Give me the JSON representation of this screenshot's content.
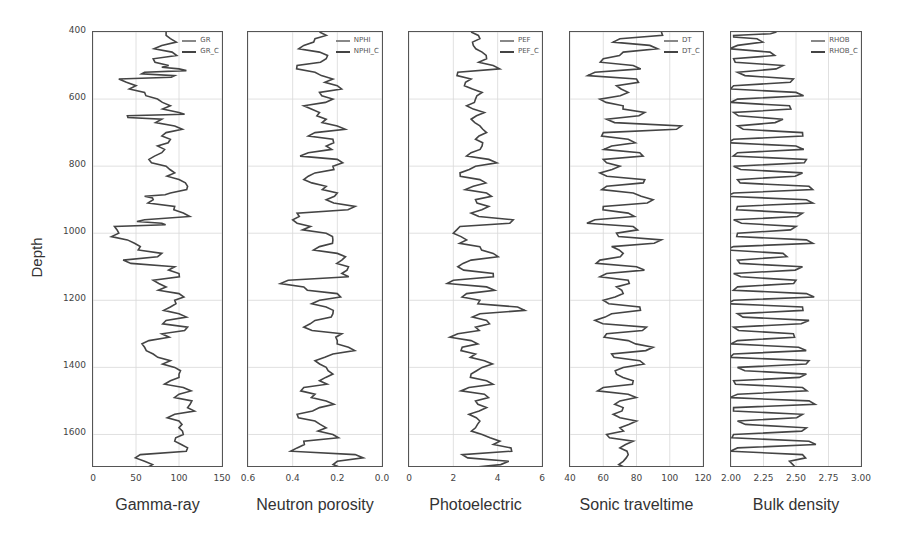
{
  "figure": {
    "ylabel": "Depth",
    "yticks": [
      "400",
      "600",
      "800",
      "1000",
      "1200",
      "1400",
      "1600"
    ],
    "ylim": [
      400,
      1700
    ]
  },
  "chart_data": [
    {
      "type": "line",
      "title": "Gamma-ray",
      "xlabel": "Gamma-ray",
      "ylabel": "Depth",
      "xlim": [
        0,
        150
      ],
      "ylim": [
        1700,
        400
      ],
      "xticks": [
        "0",
        "50",
        "100",
        "150"
      ],
      "legend": [
        "GR",
        "GR_C"
      ],
      "legend_position": "upper right",
      "grid": true,
      "depth": [
        400,
        420,
        440,
        460,
        480,
        500,
        510,
        520,
        530,
        540,
        560,
        580,
        600,
        620,
        640,
        650,
        660,
        680,
        700,
        720,
        740,
        760,
        780,
        800,
        820,
        840,
        860,
        880,
        890,
        900,
        920,
        940,
        960,
        970,
        980,
        1000,
        1020,
        1040,
        1060,
        1080,
        1100,
        1120,
        1140,
        1160,
        1180,
        1200,
        1220,
        1240,
        1260,
        1280,
        1300,
        1320,
        1340,
        1360,
        1380,
        1400,
        1420,
        1440,
        1460,
        1480,
        1500,
        1520,
        1540,
        1560,
        1580,
        1600,
        1620,
        1640,
        1660,
        1680,
        1700
      ],
      "values": [
        85,
        90,
        80,
        92,
        70,
        88,
        100,
        60,
        95,
        30,
        50,
        60,
        75,
        90,
        100,
        40,
        80,
        95,
        85,
        90,
        75,
        80,
        65,
        85,
        95,
        100,
        110,
        90,
        60,
        70,
        95,
        105,
        60,
        80,
        25,
        30,
        40,
        55,
        80,
        35,
        95,
        100,
        70,
        85,
        100,
        95,
        90,
        100,
        85,
        110,
        80,
        65,
        60,
        70,
        90,
        95,
        100,
        90,
        105,
        100,
        115,
        110,
        95,
        100,
        100,
        105,
        95,
        110,
        55,
        60,
        62
      ]
    },
    {
      "type": "line",
      "title": "Neutron porosity",
      "xlabel": "Neutron porosity",
      "ylabel": "Depth",
      "xlim": [
        0.6,
        0.0
      ],
      "ylim": [
        1700,
        400
      ],
      "xticks": [
        "0.6",
        "0.4",
        "0.2",
        "0.0"
      ],
      "legend": [
        "NPHI",
        "NPHI_C"
      ],
      "legend_position": "upper right",
      "grid": true,
      "depth": [
        400,
        420,
        440,
        460,
        480,
        500,
        520,
        540,
        560,
        580,
        600,
        620,
        640,
        660,
        680,
        700,
        720,
        740,
        760,
        780,
        800,
        820,
        840,
        860,
        880,
        900,
        920,
        940,
        960,
        980,
        1000,
        1020,
        1040,
        1060,
        1080,
        1100,
        1120,
        1140,
        1160,
        1180,
        1200,
        1220,
        1240,
        1260,
        1280,
        1300,
        1320,
        1340,
        1360,
        1380,
        1400,
        1420,
        1440,
        1460,
        1480,
        1500,
        1520,
        1540,
        1560,
        1580,
        1600,
        1620,
        1640,
        1660,
        1680,
        1700
      ],
      "values": [
        0.28,
        0.3,
        0.35,
        0.28,
        0.25,
        0.38,
        0.3,
        0.22,
        0.2,
        0.28,
        0.22,
        0.35,
        0.28,
        0.25,
        0.2,
        0.3,
        0.22,
        0.25,
        0.33,
        0.2,
        0.22,
        0.3,
        0.35,
        0.25,
        0.2,
        0.25,
        0.12,
        0.38,
        0.4,
        0.32,
        0.25,
        0.22,
        0.28,
        0.2,
        0.18,
        0.15,
        0.18,
        0.42,
        0.35,
        0.2,
        0.28,
        0.25,
        0.22,
        0.3,
        0.35,
        0.18,
        0.2,
        0.15,
        0.22,
        0.3,
        0.25,
        0.22,
        0.28,
        0.35,
        0.3,
        0.25,
        0.28,
        0.38,
        0.3,
        0.25,
        0.22,
        0.35,
        0.38,
        0.12,
        0.2,
        0.18
      ]
    },
    {
      "type": "line",
      "title": "Photoelectric",
      "xlabel": "Photoelectric",
      "ylabel": "Depth",
      "xlim": [
        0,
        6
      ],
      "ylim": [
        1700,
        400
      ],
      "xticks": [
        "0",
        "2",
        "4",
        "6"
      ],
      "legend": [
        "PEF",
        "PEF_C"
      ],
      "legend_position": "upper right",
      "grid": true,
      "depth": [
        400,
        420,
        440,
        460,
        480,
        500,
        520,
        540,
        560,
        580,
        600,
        620,
        640,
        660,
        680,
        700,
        720,
        740,
        760,
        780,
        800,
        820,
        840,
        860,
        880,
        900,
        920,
        940,
        960,
        980,
        1000,
        1020,
        1040,
        1060,
        1080,
        1100,
        1120,
        1140,
        1160,
        1180,
        1200,
        1220,
        1240,
        1260,
        1280,
        1300,
        1320,
        1340,
        1360,
        1380,
        1400,
        1420,
        1440,
        1460,
        1480,
        1500,
        1520,
        1540,
        1560,
        1580,
        1600,
        1620,
        1640,
        1660,
        1680,
        1700
      ],
      "values": [
        2.8,
        3.2,
        2.9,
        3.3,
        3.5,
        3.8,
        2.2,
        2.8,
        2.5,
        3.3,
        3.0,
        2.6,
        3.4,
        2.8,
        3.2,
        3.5,
        3.0,
        3.3,
        2.8,
        3.6,
        3.0,
        2.3,
        3.2,
        2.9,
        3.5,
        3.0,
        3.6,
        2.8,
        4.7,
        2.3,
        2.0,
        2.6,
        3.2,
        3.8,
        2.8,
        2.2,
        3.8,
        2.0,
        3.5,
        2.6,
        3.2,
        4.9,
        3.2,
        3.5,
        3.0,
        2.2,
        2.8,
        2.4,
        3.0,
        3.4,
        3.3,
        2.8,
        3.5,
        2.7,
        3.4,
        3.0,
        3.5,
        2.7,
        3.2,
        3.0,
        3.3,
        4.1,
        4.6,
        2.4,
        4.5,
        2.6
      ]
    },
    {
      "type": "line",
      "title": "Sonic traveltime",
      "xlabel": "Sonic traveltime",
      "ylabel": "Depth",
      "xlim": [
        40,
        120
      ],
      "ylim": [
        1700,
        400
      ],
      "xticks": [
        "40",
        "60",
        "80",
        "100",
        "120"
      ],
      "legend": [
        "DT",
        "DT_C"
      ],
      "legend_position": "upper right",
      "grid": true,
      "depth": [
        400,
        420,
        440,
        460,
        480,
        500,
        520,
        540,
        560,
        580,
        600,
        620,
        640,
        660,
        680,
        700,
        720,
        740,
        760,
        780,
        800,
        820,
        840,
        860,
        880,
        900,
        920,
        940,
        960,
        980,
        1000,
        1020,
        1040,
        1060,
        1080,
        1100,
        1120,
        1140,
        1160,
        1180,
        1200,
        1220,
        1240,
        1260,
        1280,
        1300,
        1320,
        1340,
        1360,
        1380,
        1400,
        1420,
        1440,
        1460,
        1480,
        1500,
        1520,
        1540,
        1560,
        1580,
        1600,
        1620,
        1640,
        1660,
        1680,
        1700
      ],
      "values": [
        95,
        70,
        88,
        72,
        60,
        78,
        55,
        80,
        68,
        75,
        58,
        72,
        85,
        62,
        107,
        60,
        75,
        65,
        82,
        60,
        70,
        58,
        85,
        62,
        78,
        90,
        60,
        75,
        55,
        78,
        68,
        95,
        65,
        72,
        58,
        80,
        62,
        75,
        68,
        72,
        60,
        82,
        65,
        55,
        86,
        62,
        75,
        90,
        65,
        82,
        72,
        68,
        78,
        60,
        75,
        70,
        72,
        66,
        80,
        70,
        62,
        78,
        70,
        75,
        72,
        74
      ]
    },
    {
      "type": "line",
      "title": "Bulk density",
      "xlabel": "Bulk density",
      "ylabel": "Depth",
      "xlim": [
        2.0,
        3.0
      ],
      "ylim": [
        1700,
        400
      ],
      "xticks": [
        "2.00",
        "2.25",
        "2.50",
        "2.75",
        "3.00"
      ],
      "legend": [
        "RHOB",
        "RHOB_C"
      ],
      "legend_position": "upper right",
      "grid": true,
      "depth": [
        400,
        410,
        420,
        440,
        460,
        480,
        500,
        520,
        540,
        560,
        580,
        600,
        620,
        640,
        660,
        680,
        700,
        720,
        740,
        760,
        780,
        800,
        820,
        840,
        860,
        880,
        900,
        920,
        940,
        960,
        980,
        1000,
        1020,
        1040,
        1060,
        1080,
        1100,
        1120,
        1140,
        1160,
        1180,
        1200,
        1220,
        1240,
        1260,
        1280,
        1300,
        1320,
        1340,
        1360,
        1380,
        1400,
        1420,
        1440,
        1460,
        1480,
        1500,
        1520,
        1540,
        1560,
        1580,
        1600,
        1620,
        1640,
        1660,
        1680,
        1700
      ],
      "values": [
        2.35,
        2.02,
        2.2,
        2.05,
        2.3,
        2.02,
        2.4,
        2.05,
        2.48,
        2.02,
        2.5,
        2.05,
        2.45,
        2.02,
        2.4,
        2.05,
        2.55,
        2.02,
        2.5,
        2.05,
        2.58,
        2.02,
        2.55,
        2.05,
        2.6,
        2.02,
        2.58,
        2.05,
        2.55,
        2.02,
        2.5,
        2.05,
        2.58,
        2.02,
        2.4,
        2.05,
        2.55,
        2.02,
        2.5,
        2.05,
        2.58,
        2.02,
        2.55,
        2.05,
        2.6,
        2.02,
        2.48,
        2.05,
        2.52,
        2.02,
        2.6,
        2.05,
        2.58,
        2.02,
        2.55,
        2.05,
        2.6,
        2.02,
        2.55,
        2.05,
        2.58,
        2.02,
        2.6,
        2.05,
        2.55,
        2.45,
        2.5
      ]
    }
  ],
  "colors": {
    "curve": "#444444",
    "curve_corrected": "#3a3a3a",
    "legend_raw": "#888888",
    "legend_corrected": "#444444",
    "grid": "#d8d8d8",
    "axis": "#555555"
  }
}
